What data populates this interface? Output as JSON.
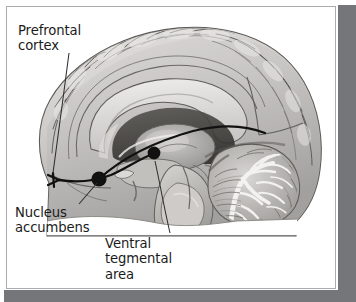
{
  "figure": {
    "kind": "anatomical-illustration",
    "rendering": "grayscale photographic brain specimen with black overlay pathway arrows",
    "frame": {
      "card_background": "#ffffff",
      "border_color": "#a9abae",
      "shadow_color": "#74767a"
    }
  },
  "labels": {
    "prefrontal_cortex": "Prefrontal\ncortex",
    "nucleus_accumbens": "Nucleus\naccumbens",
    "ventral_tegmental_area": "Ventral\ntegmental\narea"
  },
  "annotations": {
    "pathway_color": "#111111",
    "marker_color": "#111111",
    "leader_color": "#3a3a3a",
    "structures": [
      {
        "name": "Prefrontal cortex",
        "marker": "arrowhead",
        "marker_x": 43,
        "marker_y": 169,
        "leader_from_x": 62,
        "leader_from_y": 52
      },
      {
        "name": "Nucleus accumbens",
        "marker": "filled-dot",
        "marker_x": 92,
        "marker_y": 172,
        "marker_r": 7.5,
        "leader_from_x": 72,
        "leader_from_y": 196
      },
      {
        "name": "Ventral tegmental area",
        "marker": "filled-dot",
        "marker_x": 147,
        "marker_y": 146,
        "marker_r": 6.5,
        "leader_from_x": 160,
        "leader_from_y": 228
      }
    ],
    "pathways": [
      {
        "name": "mesocortical projection",
        "from": "Ventral tegmental area",
        "to": "Prefrontal cortex"
      },
      {
        "name": "mesolimbic projection",
        "from": "Ventral tegmental area",
        "to": "Nucleus accumbens"
      }
    ]
  },
  "brain_regions": [
    "cerebral cortex",
    "cingulate gyrus",
    "corpus callosum",
    "lateral ventricle",
    "thalamus",
    "hypothalamus",
    "midbrain",
    "pons",
    "medulla",
    "cerebellum",
    "arbor vitae"
  ]
}
